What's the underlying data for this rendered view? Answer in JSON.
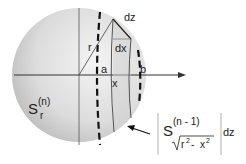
{
  "diagram": {
    "labels": {
      "r": "r",
      "a": "a",
      "b": "b",
      "x": "x",
      "dx": "dx",
      "dz": "dz",
      "sphere_S": "S",
      "sphere_sup": "(n)",
      "sphere_sub": "r",
      "formula_S": "S",
      "formula_sup": "(n - 1)",
      "formula_sqrt_r": "r",
      "formula_sqrt_r_exp": "2",
      "formula_minus": "-",
      "formula_sqrt_x": "x",
      "formula_sqrt_x_exp": "2",
      "formula_dz": "dz"
    },
    "colors": {
      "sphere_light": "#f2f2f2",
      "sphere_dark": "#b8b8b8",
      "line": "#333333",
      "formula_bar": "#999999"
    }
  }
}
